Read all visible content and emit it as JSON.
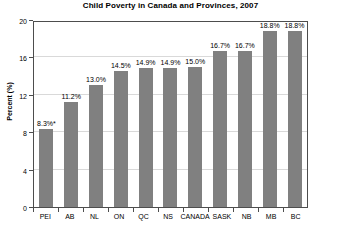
{
  "chart_data": {
    "type": "bar",
    "title": "Child Poverty in Canada and Provinces, 2007",
    "xlabel": "",
    "ylabel": "Percent (%)",
    "ylim": [
      0,
      20
    ],
    "yticks": [
      0,
      4,
      8,
      12,
      16,
      20
    ],
    "grid": true,
    "legend": "none",
    "bar_color": "#808080",
    "categories": [
      "PEI",
      "AB",
      "NL",
      "ON",
      "QC",
      "NS",
      "CANADA",
      "SASK",
      "NB",
      "MB",
      "BC"
    ],
    "values": [
      8.3,
      11.2,
      13.0,
      14.5,
      14.9,
      14.9,
      15.0,
      16.7,
      16.7,
      18.8,
      18.8
    ],
    "data_labels": [
      "8.3%*",
      "11.2%",
      "13.0%",
      "14.5%",
      "14.9%",
      "14.9%",
      "15.0%",
      "16.7%",
      "16.7%",
      "18.8%",
      "18.8%"
    ],
    "annotations": [
      "* asterisk on PEI value"
    ]
  },
  "axis": {
    "y_tick_labels": [
      "20",
      "16",
      "12",
      "8",
      "4",
      "0"
    ]
  }
}
